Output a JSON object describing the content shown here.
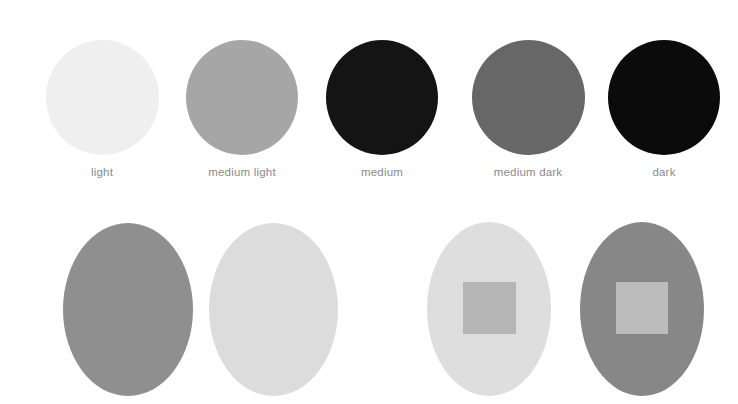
{
  "value_scale": {
    "swatches": [
      {
        "label": "light",
        "color": "#efefef"
      },
      {
        "label": "medium light",
        "color": "#a6a6a6"
      },
      {
        "label": "medium",
        "color": "#141414"
      },
      {
        "label": "medium dark",
        "color": "#676767"
      },
      {
        "label": "dark",
        "color": "#0b0b0b"
      }
    ]
  },
  "contrast_demo": {
    "ovals": [
      {
        "color": "#8f8f8f"
      },
      {
        "color": "#dcdcdc"
      },
      {
        "color": "#dedede",
        "inner_square_color": "#b5b5b5"
      },
      {
        "color": "#878787",
        "inner_square_color": "#bcbcbc"
      }
    ]
  }
}
